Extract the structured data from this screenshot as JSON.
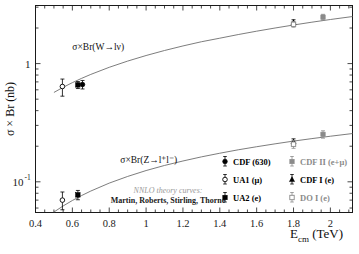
{
  "chart_data": {
    "type": "scatter",
    "title": "",
    "xlabel": "E_cm (TeV)",
    "ylabel": "σ × Br (nb)",
    "xlim": [
      0.4,
      2.12
    ],
    "ylim": [
      0.055,
      3.1
    ],
    "yscale": "log",
    "xscale": "linear",
    "grid": false,
    "xticks": [
      "0.4",
      "0.6",
      "0.8",
      "1",
      "1.2",
      "1.4",
      "1.6",
      "1.8",
      "2"
    ],
    "xtick_values": [
      0.4,
      0.6,
      0.8,
      1.0,
      1.2,
      1.4,
      1.6,
      1.8,
      2.0
    ],
    "yticks": [
      "1",
      "10"
    ],
    "ytick_values": [
      1.0,
      0.1
    ],
    "ytick_exponents": [
      "",
      "-1"
    ],
    "annotations": [
      {
        "text": "σ×Br(W→lν)",
        "x": 0.6,
        "y": 1.3
      },
      {
        "text": "σ×Br(Z→l⁺l⁻)",
        "x": 0.86,
        "y": 0.145
      }
    ],
    "theory_note": {
      "line1": "NNLO theory curves:",
      "line2": "Martin, Roberts, Stirling, Thorne"
    },
    "curves": [
      {
        "name": "W_theory",
        "label": "σ×Br(W→lν) NNLO",
        "x": [
          0.5,
          0.55,
          0.6,
          0.65,
          0.7,
          0.8,
          0.9,
          1.0,
          1.1,
          1.2,
          1.3,
          1.4,
          1.5,
          1.6,
          1.7,
          1.8,
          1.9,
          2.0,
          2.12
        ],
        "y": [
          0.57,
          0.63,
          0.69,
          0.75,
          0.81,
          0.93,
          1.05,
          1.17,
          1.29,
          1.41,
          1.53,
          1.64,
          1.76,
          1.88,
          2.0,
          2.12,
          2.24,
          2.36,
          2.5
        ]
      },
      {
        "name": "Z_theory",
        "label": "σ×Br(Z→l⁺l⁻) NNLO",
        "x": [
          0.5,
          0.55,
          0.6,
          0.65,
          0.7,
          0.8,
          0.9,
          1.0,
          1.1,
          1.2,
          1.3,
          1.4,
          1.5,
          1.6,
          1.7,
          1.8,
          1.9,
          2.0,
          2.12
        ],
        "y": [
          0.0555,
          0.0625,
          0.0695,
          0.0765,
          0.0835,
          0.0975,
          0.111,
          0.1245,
          0.1375,
          0.15,
          0.1625,
          0.1745,
          0.1865,
          0.198,
          0.2095,
          0.221,
          0.232,
          0.243,
          0.256
        ]
      }
    ],
    "series": [
      {
        "name": "UA1 (μ)",
        "marker": "open-circle",
        "color": "#000000",
        "points": [
          {
            "x": 0.546,
            "y": 0.64,
            "yerr_low": 0.11,
            "yerr_high": 0.1,
            "boson": "W"
          },
          {
            "x": 0.546,
            "y": 0.07,
            "yerr_low": 0.012,
            "yerr_high": 0.012,
            "boson": "Z"
          }
        ]
      },
      {
        "name": "UA2 (e)",
        "marker": "filled-square",
        "color": "#000000",
        "points": [
          {
            "x": 0.63,
            "y": 0.66,
            "yerr_low": 0.045,
            "yerr_high": 0.045,
            "boson": "W"
          },
          {
            "x": 0.63,
            "y": 0.0775,
            "yerr_low": 0.007,
            "yerr_high": 0.007,
            "boson": "Z"
          }
        ]
      },
      {
        "name": "CDF (630)",
        "marker": "filled-circle",
        "color": "#000000",
        "points": [
          {
            "x": 0.655,
            "y": 0.665,
            "yerr_low": 0.055,
            "yerr_high": 0.055,
            "boson": "W"
          }
        ]
      },
      {
        "name": "CDF I (e)",
        "marker": "filled-triangle",
        "color": "#000000",
        "points": [
          {
            "x": 1.8,
            "y": 2.23,
            "yerr_low": 0.12,
            "yerr_high": 0.12,
            "boson": "W"
          },
          {
            "x": 1.8,
            "y": 0.218,
            "yerr_low": 0.013,
            "yerr_high": 0.013,
            "boson": "Z"
          }
        ]
      },
      {
        "name": "D0 I (e)",
        "marker": "open-square-gray",
        "color": "#8a8a8a",
        "points": [
          {
            "x": 1.8,
            "y": 2.15,
            "yerr_low": 0.12,
            "yerr_high": 0.12,
            "boson": "W"
          },
          {
            "x": 1.8,
            "y": 0.208,
            "yerr_low": 0.016,
            "yerr_high": 0.016,
            "boson": "Z"
          }
        ]
      },
      {
        "name": "CDF II (e+μ)",
        "marker": "gray-square",
        "color": "#8a8a8a",
        "points": [
          {
            "x": 1.96,
            "y": 2.47,
            "yerr_low": 0.14,
            "yerr_high": 0.14,
            "boson": "W"
          },
          {
            "x": 1.96,
            "y": 0.252,
            "yerr_low": 0.018,
            "yerr_high": 0.018,
            "boson": "Z"
          }
        ]
      }
    ],
    "legend": {
      "position": "lower-right",
      "entries": [
        {
          "label": "CDF (630)",
          "marker": "filled-circle",
          "color": "#000000",
          "col": 0,
          "row": 0
        },
        {
          "label": "CDF II (e+μ)",
          "marker": "gray-square",
          "color": "#8a8a8a",
          "col": 1,
          "row": 0
        },
        {
          "label": "UA1 (μ)",
          "marker": "open-circle",
          "color": "#000000",
          "col": 0,
          "row": 1
        },
        {
          "label": "CDF I (e)",
          "marker": "filled-triangle",
          "color": "#000000",
          "col": 1,
          "row": 1
        },
        {
          "label": "UA2 (e)",
          "marker": "filled-square",
          "color": "#000000",
          "col": 0,
          "row": 2
        },
        {
          "label": "DO I (e)",
          "marker": "open-square-gray",
          "color": "#8a8a8a",
          "col": 1,
          "row": 2
        }
      ]
    }
  },
  "axis": {
    "x_title_main": "E",
    "x_title_sub": "cm",
    "x_title_unit": " (TeV)",
    "y_title": "σ × Br (nb)",
    "y_label_1": "1",
    "y_label_10": "10",
    "y_label_exp": "-1"
  }
}
